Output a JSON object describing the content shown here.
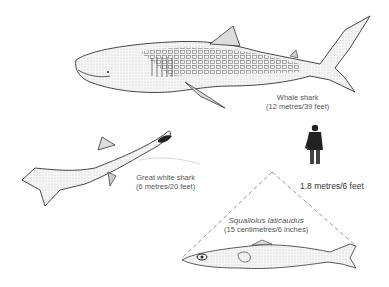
{
  "figure": {
    "type": "size-comparison-illustration",
    "subjects": [
      {
        "id": "whale_shark",
        "name": "Whale shark",
        "size": "(12 metres/39 feet)"
      },
      {
        "id": "great_white",
        "name": "Great white shark",
        "size": "(6 metres/20 feet)"
      },
      {
        "id": "human",
        "name": "",
        "size": "1.8 metres/6 feet"
      },
      {
        "id": "squaliolus",
        "name": "Squaliolus laticaudus",
        "size": "(15 centimetres/6 inches)"
      }
    ]
  }
}
